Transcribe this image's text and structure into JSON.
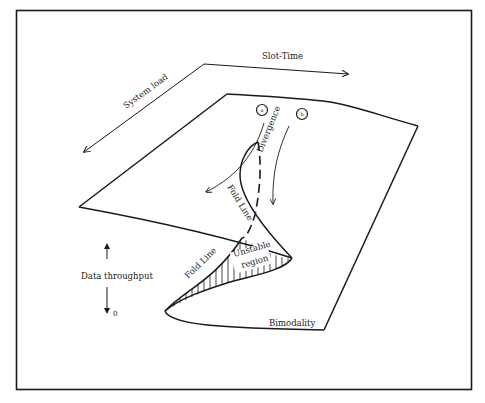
{
  "diagram": {
    "type": "cusp-catastrophe-surface",
    "axes": {
      "slot_time": "Slot-Time",
      "system_load": "System load",
      "data_throughput": "Data throughput",
      "throughput_zero": "0"
    },
    "markers": {
      "a": "a",
      "b": "b"
    },
    "labels": {
      "divergence": "Divergence",
      "fold_line_upper": "Fold Line",
      "fold_line_lower": "Fold Line",
      "unstable_line1": "Unstable",
      "unstable_line2": "region",
      "bimodality": "Bimodality"
    },
    "colors": {
      "stroke": "#1a1a1a",
      "background": "#ffffff"
    }
  }
}
